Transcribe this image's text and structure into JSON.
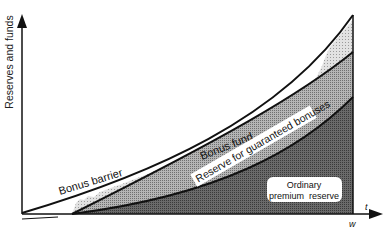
{
  "diagram": {
    "y_axis_label": "Reserves and funds",
    "x_axis_label_t": "t",
    "x_axis_label_w": "w",
    "regions": [
      {
        "name": "Bonus barrier",
        "type": "curve-label"
      },
      {
        "name": "Bonus fund",
        "type": "band-label"
      },
      {
        "name": "Reserve for guaranteed bonuses",
        "type": "band-label"
      },
      {
        "name": "Ordinary premium reserve",
        "type": "region-label",
        "lines": [
          "Ordinary",
          "premium  reserve"
        ]
      }
    ],
    "labels": {
      "bonus_barrier": "Bonus barrier",
      "bonus_fund": "Bonus fund",
      "reserve_guaranteed": "Reserve for guaranteed bonuses",
      "ordinary_line1": "Ordinary",
      "ordinary_line2": "premium  reserve"
    },
    "colors": {
      "background": "#ffffff",
      "lines": "#111111",
      "bonus_fund_fill": "#d9d9d9",
      "guaranteed_fill": "#a8a8a8",
      "ordinary_fill": "#5e5e5e"
    }
  }
}
